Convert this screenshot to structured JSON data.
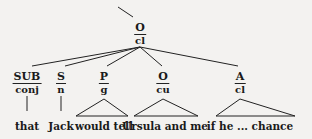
{
  "tree": {
    "root": {
      "function": "O",
      "category": "cl"
    },
    "children": [
      {
        "function": "SUB",
        "category": "conj",
        "leaf": "that",
        "link": "line"
      },
      {
        "function": "S",
        "category": "n",
        "leaf": "Jack",
        "link": "line"
      },
      {
        "function": "P",
        "category": "g",
        "leaf": "would tell",
        "link": "triangle"
      },
      {
        "function": "O",
        "category": "cu",
        "leaf": "Ursula and me",
        "link": "triangle"
      },
      {
        "function": "A",
        "category": "cl",
        "leaf": "if he ... chance",
        "link": "triangle"
      }
    ]
  }
}
